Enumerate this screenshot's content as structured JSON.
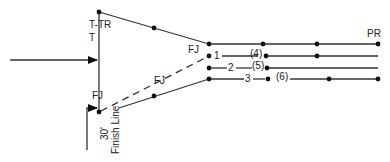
{
  "diagram": {
    "labels": {
      "t_tr": "T-TR",
      "t": "T",
      "fj_top": "FJ",
      "fj_mid": "FJ",
      "fj_bottom": "FJ",
      "pr": "PR",
      "lane1": "1",
      "lane2": "2",
      "lane3": "3",
      "lane4": "(4)",
      "lane5": "(5)",
      "lane6": "(6)",
      "distance": "30'",
      "finish_line": "Finish Line"
    },
    "colors": {
      "line": "#333333",
      "dot": "#111111",
      "background": "#ffffff"
    }
  }
}
